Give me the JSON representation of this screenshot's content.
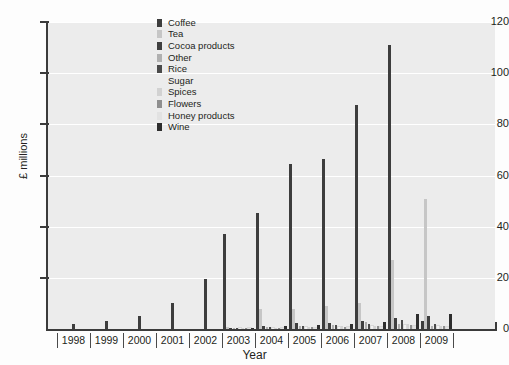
{
  "chart_data": {
    "type": "bar",
    "title": "",
    "xlabel": "Year",
    "ylabel": "£ millions",
    "ylim": [
      0,
      120
    ],
    "yticks": [
      0,
      20,
      40,
      60,
      80,
      100,
      120
    ],
    "grid": true,
    "legend_position": "top-left-inside",
    "categories": [
      "1998",
      "1999",
      "2000",
      "2001",
      "2002",
      "2003",
      "2004",
      "2005",
      "2006",
      "2007",
      "2008",
      "2009"
    ],
    "series": [
      {
        "name": "Coffee",
        "color": "#3d3d3d",
        "values": [
          2.0,
          3.0,
          5.0,
          10.0,
          19.5,
          37.0,
          45.5,
          64.5,
          66.5,
          87.5,
          111.0,
          3.0
        ]
      },
      {
        "name": "Tea",
        "color": "#c6c6c6",
        "values": [
          0,
          0,
          0,
          0,
          0,
          0.7,
          8.0,
          8.0,
          9.0,
          10.0,
          27.0,
          51.0
        ]
      },
      {
        "name": "Cocoa products",
        "color": "#3f3f3f",
        "values": [
          0,
          0,
          0,
          0,
          0,
          0.5,
          1.2,
          2.2,
          2.3,
          3.0,
          4.5,
          5.0
        ]
      },
      {
        "name": "Other",
        "color": "#b0b0b0",
        "values": [
          0,
          0,
          0,
          0,
          0,
          0.3,
          0.6,
          1.0,
          1.4,
          2.6,
          2.0,
          1.2
        ]
      },
      {
        "name": "Rice",
        "color": "#4a4a4a",
        "values": [
          0,
          0,
          0,
          0,
          0,
          0.4,
          0.8,
          1.3,
          1.5,
          1.8,
          3.4,
          2.0
        ]
      },
      {
        "name": "Sugar",
        "color": "#f2f2f2",
        "values": [
          0,
          0,
          0,
          0,
          0,
          0.2,
          0.4,
          0.6,
          0.8,
          1.0,
          1.4,
          1.0
        ]
      },
      {
        "name": "Spices",
        "color": "#d2d2d2",
        "values": [
          0,
          0,
          0,
          0,
          0,
          0.3,
          0.5,
          0.8,
          1.0,
          1.2,
          1.8,
          1.3
        ]
      },
      {
        "name": "Flowers",
        "color": "#8f8f8f",
        "values": [
          0,
          0,
          0,
          0,
          0,
          0.3,
          0.5,
          0.7,
          0.9,
          1.1,
          1.6,
          1.1
        ]
      },
      {
        "name": "Honey products",
        "color": "#e2e2e2",
        "values": [
          0,
          0,
          0,
          0,
          0,
          0.2,
          0.3,
          0.5,
          0.6,
          0.8,
          1.1,
          0.8
        ]
      },
      {
        "name": "Wine",
        "color": "#2e2e2e",
        "values": [
          0,
          0,
          0,
          0,
          0,
          0.5,
          1.0,
          1.6,
          2.0,
          2.8,
          6.0,
          6.0
        ]
      }
    ]
  },
  "legend": {
    "items": [
      {
        "label": "Coffee"
      },
      {
        "label": "Tea"
      },
      {
        "label": "Cocoa products"
      },
      {
        "label": "Other"
      },
      {
        "label": "Rice"
      },
      {
        "label": "Sugar"
      },
      {
        "label": "Spices"
      },
      {
        "label": "Flowers"
      },
      {
        "label": "Honey products"
      },
      {
        "label": "Wine"
      }
    ]
  },
  "colors": {
    "plot_background": "#ececec",
    "gridline": "#ffffff",
    "axis": "#3b3b3b",
    "text": "#231f20"
  }
}
